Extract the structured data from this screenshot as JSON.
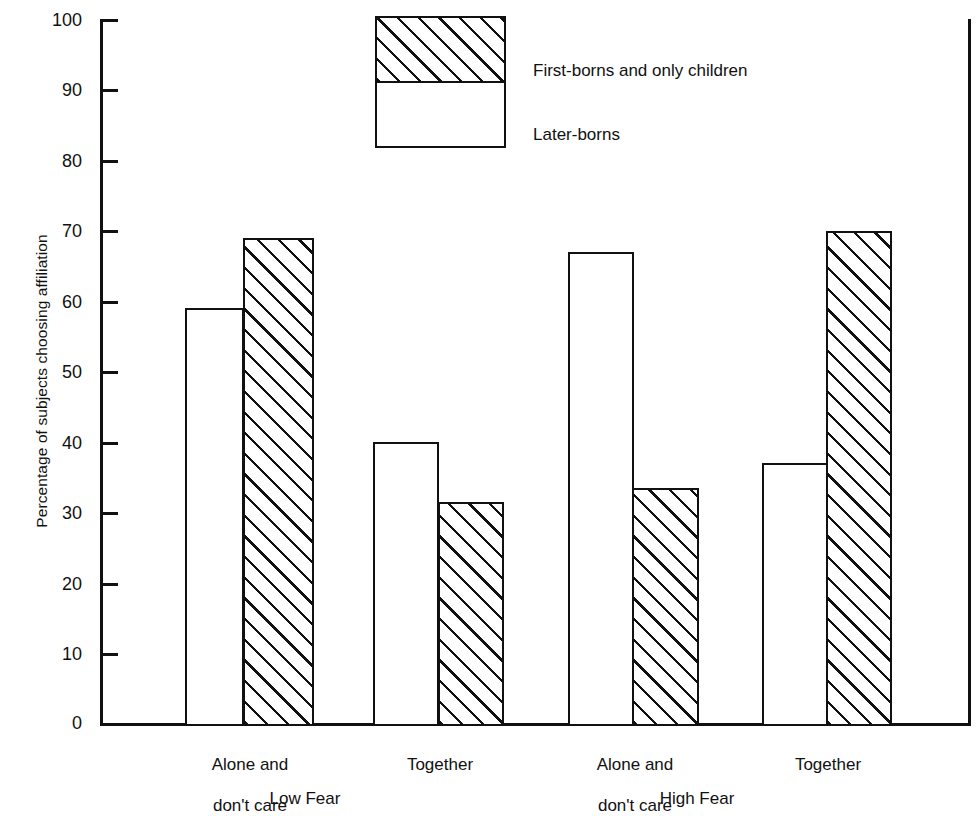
{
  "chart_data": {
    "type": "bar",
    "title": "",
    "subtitle": "",
    "xlabel": "",
    "ylabel": "Percentage of subjects choosing affiliation",
    "ylim": [
      0,
      100
    ],
    "ytick_values": [
      0,
      10,
      20,
      30,
      40,
      50,
      60,
      70,
      80,
      90,
      100
    ],
    "ytick_labels": [
      "0",
      "10",
      "20",
      "30",
      "40",
      "50",
      "60",
      "70",
      "80",
      "90",
      "100"
    ],
    "grid": false,
    "legend_position": "top-center",
    "groups": [
      "Low Fear",
      "High Fear"
    ],
    "categories": [
      "Alone and\ndon't care",
      "Together",
      "Alone and\ndon't care",
      "Together"
    ],
    "category_lines": [
      [
        "Alone and",
        "don't care"
      ],
      [
        "Together"
      ],
      [
        "Alone and",
        "don't care"
      ],
      [
        "Together"
      ]
    ],
    "series": [
      {
        "name": "Later-borns",
        "fill": "white",
        "values": [
          59,
          40,
          67,
          37
        ]
      },
      {
        "name": "First-borns and only children",
        "fill": "hatched",
        "values": [
          69,
          31.5,
          33.5,
          70
        ]
      }
    ],
    "bars": [
      {
        "group": "Low Fear",
        "category": "Alone and don't care",
        "series": "Later-borns",
        "value": 59
      },
      {
        "group": "Low Fear",
        "category": "Alone and don't care",
        "series": "First-borns and only children",
        "value": 69
      },
      {
        "group": "Low Fear",
        "category": "Together",
        "series": "Later-borns",
        "value": 40
      },
      {
        "group": "Low Fear",
        "category": "Together",
        "series": "First-borns and only children",
        "value": 31.5
      },
      {
        "group": "High Fear",
        "category": "Alone and don't care",
        "series": "Later-borns",
        "value": 67
      },
      {
        "group": "High Fear",
        "category": "Alone and don't care",
        "series": "First-borns and only children",
        "value": 33.5
      },
      {
        "group": "High Fear",
        "category": "Together",
        "series": "Later-borns",
        "value": 37
      },
      {
        "group": "High Fear",
        "category": "Together",
        "series": "First-borns and only children",
        "value": 70
      }
    ],
    "colors": {
      "axis": "#111111",
      "bar_outline": "#111111",
      "bar_fill_white": "#ffffff",
      "hatch_line": "#111111",
      "background": "#ffffff"
    }
  },
  "axis": {
    "y_label": "Percentage of subjects choosing affiliation",
    "ticks": [
      "100",
      "90",
      "80",
      "70",
      "60",
      "50",
      "40",
      "30",
      "20",
      "10",
      "0"
    ]
  },
  "legend": {
    "entries": [
      {
        "label": "First-borns and only children",
        "fill": "hatched"
      },
      {
        "label": "Later-borns",
        "fill": "white"
      }
    ]
  },
  "x_axis": {
    "category_labels": [
      {
        "line1": "Alone and",
        "line2": "don't care"
      },
      {
        "line1": "Together",
        "line2": ""
      },
      {
        "line1": "Alone and",
        "line2": "don't care"
      },
      {
        "line1": "Together",
        "line2": ""
      }
    ],
    "group_labels": [
      "Low Fear",
      "High Fear"
    ]
  }
}
